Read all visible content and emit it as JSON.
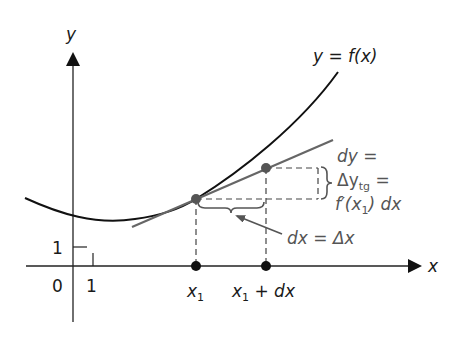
{
  "figure": {
    "axes": {
      "x_label": "x",
      "y_label": "y",
      "origin_label": "0",
      "x_unit_label": "1",
      "y_unit_label": "1"
    },
    "curve": {
      "label": "y = f(x)"
    },
    "points": {
      "x1_label": "x",
      "x1_sub": "1",
      "x1dx_label_a": "x",
      "x1dx_sub": "1",
      "x1dx_label_b": " + dx"
    },
    "annotations": {
      "dy_line1": "dy =",
      "dy_line2_main": "Δy",
      "dy_line2_sub": "tg",
      "dy_line2_eq": " =",
      "dy_line3_a": "f′(x",
      "dy_line3_sub": "1",
      "dy_line3_b": ") dx",
      "dx_label": "dx = Δx"
    },
    "colors": {
      "curve": "#111111",
      "tangent": "#666666",
      "points": "#555555",
      "axis": "#222222",
      "dash": "#444444"
    }
  }
}
